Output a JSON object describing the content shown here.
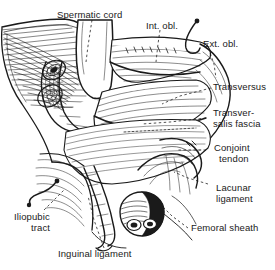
{
  "figure": {
    "background_color": "#ffffff",
    "ink_color": "#1a1a1a",
    "width": 275,
    "height": 270
  },
  "labels": {
    "spermatic_cord": "Spermatic cord",
    "int_obl": "Int. obl.",
    "ext_obl": "Ext. obl.",
    "transversus": "Transversus",
    "transversalis_fascia_line1": "Transver-",
    "transversalis_fascia_line2": "salis fascia",
    "conjoint_line1": "Conjoint",
    "conjoint_line2": "tendon",
    "lacunar_line1": "Lacunar",
    "lacunar_line2": "ligament",
    "femoral_sheath": "Femoral sheath",
    "iliopubic_line1": "Iliopubic",
    "iliopubic_line2": "tract",
    "inguinal_ligament": "Inguinal ligament"
  },
  "structures": [
    {
      "name": "spermatic-cord",
      "kind": "retracted-cord-band"
    },
    {
      "name": "internal-oblique",
      "kind": "muscle-layer"
    },
    {
      "name": "external-oblique",
      "kind": "aponeurosis-flap"
    },
    {
      "name": "transversus-abdominis",
      "kind": "muscle-layer"
    },
    {
      "name": "transversalis-fascia",
      "kind": "fascial-sheet"
    },
    {
      "name": "conjoint-tendon",
      "kind": "tendon"
    },
    {
      "name": "lacunar-ligament",
      "kind": "ligament"
    },
    {
      "name": "femoral-sheath",
      "kind": "cut-vessel-sheath"
    },
    {
      "name": "iliopubic-tract",
      "kind": "fibrous-band"
    },
    {
      "name": "inguinal-ligament",
      "kind": "ligament"
    }
  ],
  "markers": [
    {
      "name": "int-obl-pin",
      "kind": "hook-pin"
    },
    {
      "name": "ext-obl-pin",
      "kind": "hook-pin"
    },
    {
      "name": "iliopubic-pin",
      "kind": "hook-pin"
    }
  ]
}
